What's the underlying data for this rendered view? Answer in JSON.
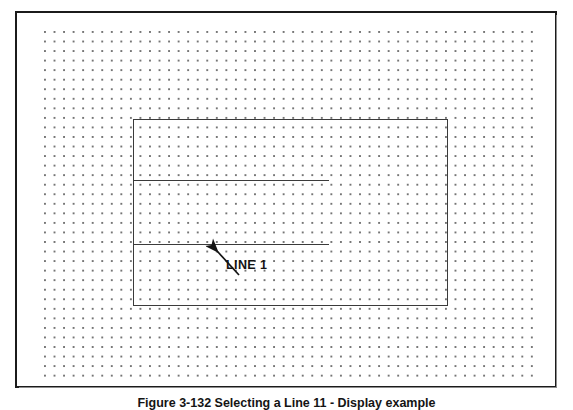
{
  "figure": {
    "caption": "Figure 3-132  Selecting a Line 11 - Display example",
    "annotation_label": "LINE 1"
  },
  "drawing": {
    "type": "cad-drawing-canvas",
    "background_color": "#ffffff",
    "frame_color": "#1b1b1b",
    "grid": {
      "name": "dot-grid",
      "dot_color": "#6e6e6e",
      "spacing_px": 9.55,
      "columns": 52,
      "rows": 37
    },
    "entities": [
      {
        "name": "inner-rectangle",
        "kind": "rectangle",
        "x": 131,
        "y": 117,
        "width": 315,
        "height": 187,
        "stroke_color": "#3b3b3b"
      },
      {
        "name": "horizontal-line-upper",
        "kind": "line",
        "x1": 131,
        "y1": 178,
        "x2": 327,
        "y2": 178,
        "stroke_color": "#3b3b3b"
      },
      {
        "name": "horizontal-line-lower",
        "kind": "line",
        "x1": 131,
        "y1": 242,
        "x2": 327,
        "y2": 242,
        "stroke_color": "#3b3b3b",
        "selected": true,
        "label": "LINE 1"
      },
      {
        "name": "leader-arrow",
        "kind": "arrow",
        "from_x": 222,
        "from_y": 262,
        "to_x": 200,
        "to_y": 238,
        "stroke_color": "#141414"
      }
    ]
  }
}
